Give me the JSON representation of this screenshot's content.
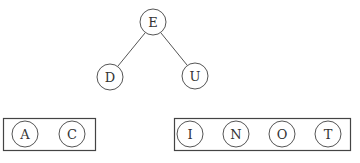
{
  "tree": {
    "nodes": [
      {
        "id": "E",
        "label": "E",
        "x": 153,
        "y": 22
      },
      {
        "id": "D",
        "label": "D",
        "x": 110,
        "y": 77
      },
      {
        "id": "U",
        "label": "U",
        "x": 195,
        "y": 76
      }
    ],
    "edges": [
      {
        "from": "E",
        "to": "D"
      },
      {
        "from": "E",
        "to": "U"
      }
    ]
  },
  "groups": [
    {
      "name": "left-group",
      "box": {
        "x": 3,
        "y": 118,
        "w": 92,
        "h": 32
      },
      "nodes": [
        {
          "label": "A",
          "x": 25,
          "y": 134
        },
        {
          "label": "C",
          "x": 72,
          "y": 134
        }
      ]
    },
    {
      "name": "right-group",
      "box": {
        "x": 174,
        "y": 118,
        "w": 176,
        "h": 32
      },
      "nodes": [
        {
          "label": "I",
          "x": 190,
          "y": 134
        },
        {
          "label": "N",
          "x": 236,
          "y": 134
        },
        {
          "label": "O",
          "x": 282,
          "y": 134
        },
        {
          "label": "T",
          "x": 328,
          "y": 134
        }
      ]
    }
  ],
  "style": {
    "stroke": "#555555",
    "node_radius": 13
  }
}
